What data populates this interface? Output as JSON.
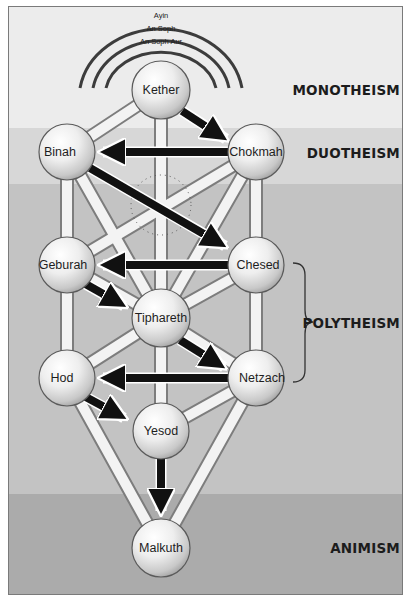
{
  "veils": [
    {
      "label": "Ayin"
    },
    {
      "label": "An Soph"
    },
    {
      "label": "An Soph Aur"
    }
  ],
  "sephiroth": {
    "kether": {
      "label": "Kether"
    },
    "chokmah": {
      "label": "Chokmah"
    },
    "binah": {
      "label": "Binah"
    },
    "chesed": {
      "label": "Chesed"
    },
    "geburah": {
      "label": "Geburah"
    },
    "tiphareth": {
      "label": "Tiphareth"
    },
    "netzach": {
      "label": "Netzach"
    },
    "hod": {
      "label": "Hod"
    },
    "yesod": {
      "label": "Yesod"
    },
    "malkuth": {
      "label": "Malkuth"
    }
  },
  "tiers": [
    {
      "label": "MONOTHEISM",
      "color": "#ececec"
    },
    {
      "label": "DUOTHEISM",
      "color": "#d7d7d7"
    },
    {
      "label": "POLYTHEISM",
      "color": "#c3c3c3"
    },
    {
      "label": "ANIMISM",
      "color": "#ababab"
    }
  ],
  "arrows": [
    {
      "from": "Kether",
      "to": "Chokmah"
    },
    {
      "from": "Chokmah",
      "to": "Binah"
    },
    {
      "from": "Binah",
      "to": "Chesed"
    },
    {
      "from": "Chesed",
      "to": "Geburah"
    },
    {
      "from": "Geburah",
      "to": "Tiphareth"
    },
    {
      "from": "Tiphareth",
      "to": "Netzach"
    },
    {
      "from": "Netzach",
      "to": "Hod"
    },
    {
      "from": "Hod",
      "to": "Yesod"
    },
    {
      "from": "Yesod",
      "to": "Malkuth"
    }
  ]
}
